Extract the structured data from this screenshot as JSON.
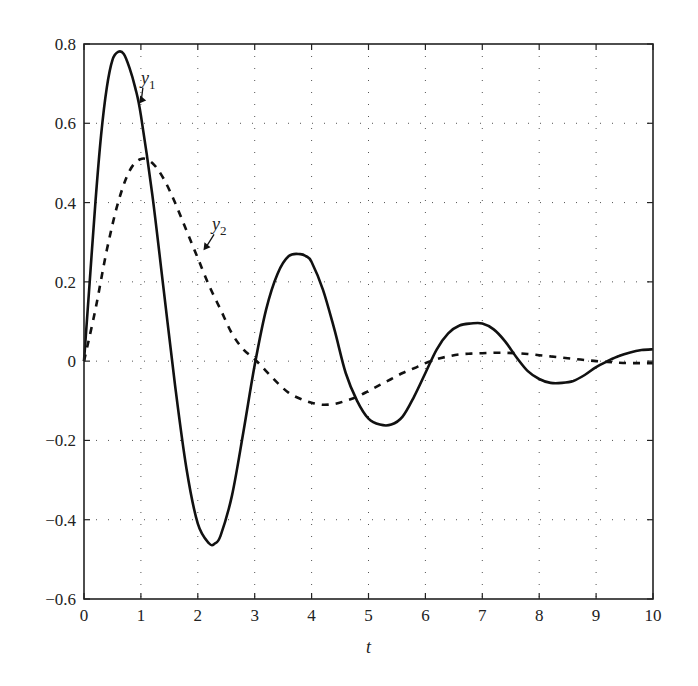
{
  "chart_data": {
    "type": "line",
    "title": "",
    "xlabel": "t",
    "ylabel": "",
    "xlim": [
      0,
      10
    ],
    "ylim": [
      -0.6,
      0.8
    ],
    "grid": true,
    "grid_style": "dotted",
    "xticks": [
      0,
      1,
      2,
      3,
      4,
      5,
      6,
      7,
      8,
      9,
      10
    ],
    "xtick_labels": [
      "0",
      "1",
      "2",
      "3",
      "4",
      "5",
      "6",
      "7",
      "8",
      "9",
      "10"
    ],
    "yticks": [
      -0.6,
      -0.4,
      -0.2,
      0,
      0.2,
      0.4,
      0.6,
      0.8
    ],
    "ytick_labels": [
      "−0.6",
      "−0.4",
      "−0.2",
      "0",
      "0.2",
      "0.4",
      "0.6",
      "0.8"
    ],
    "legend": "none (inline annotations)",
    "annotations": [
      {
        "text": "y1",
        "sub": "1",
        "base": "y",
        "x": 1.0,
        "y": 0.7,
        "arrow_to": [
          0.97,
          0.65
        ]
      },
      {
        "text": "y2",
        "sub": "2",
        "base": "y",
        "x": 2.25,
        "y": 0.33,
        "arrow_to": [
          2.1,
          0.28
        ]
      }
    ],
    "series": [
      {
        "name": "y1",
        "style": "solid",
        "x": [
          0,
          0.1,
          0.2,
          0.3,
          0.4,
          0.5,
          0.6,
          0.7,
          0.8,
          0.9,
          1.0,
          1.2,
          1.4,
          1.6,
          1.8,
          2.0,
          2.2,
          2.3,
          2.4,
          2.6,
          2.8,
          3.0,
          3.2,
          3.4,
          3.6,
          3.8,
          3.9,
          4.0,
          4.2,
          4.4,
          4.6,
          4.8,
          5.0,
          5.2,
          5.4,
          5.6,
          5.8,
          6.0,
          6.2,
          6.4,
          6.6,
          6.8,
          7.0,
          7.2,
          7.4,
          7.6,
          7.8,
          8.0,
          8.2,
          8.4,
          8.6,
          8.8,
          9.0,
          9.2,
          9.4,
          9.6,
          9.8,
          10.0
        ],
        "y": [
          0,
          0.2,
          0.4,
          0.57,
          0.69,
          0.76,
          0.78,
          0.775,
          0.74,
          0.69,
          0.62,
          0.42,
          0.18,
          -0.06,
          -0.27,
          -0.41,
          -0.46,
          -0.46,
          -0.44,
          -0.34,
          -0.18,
          -0.01,
          0.13,
          0.22,
          0.265,
          0.27,
          0.265,
          0.25,
          0.18,
          0.08,
          -0.03,
          -0.1,
          -0.145,
          -0.16,
          -0.16,
          -0.14,
          -0.09,
          -0.03,
          0.03,
          0.07,
          0.09,
          0.095,
          0.095,
          0.08,
          0.05,
          0.01,
          -0.025,
          -0.045,
          -0.055,
          -0.055,
          -0.05,
          -0.035,
          -0.015,
          0.0,
          0.013,
          0.022,
          0.028,
          0.03
        ]
      },
      {
        "name": "y2",
        "style": "dashed",
        "x": [
          0,
          0.2,
          0.4,
          0.6,
          0.8,
          1.0,
          1.2,
          1.4,
          1.6,
          1.8,
          2.0,
          2.2,
          2.4,
          2.6,
          2.8,
          3.0,
          3.2,
          3.4,
          3.6,
          3.8,
          4.0,
          4.2,
          4.4,
          4.6,
          4.8,
          5.0,
          5.2,
          5.4,
          5.6,
          5.8,
          6.0,
          6.2,
          6.4,
          6.6,
          6.8,
          7.0,
          7.2,
          7.4,
          7.6,
          7.8,
          8.0,
          8.2,
          8.4,
          8.6,
          8.8,
          9.0,
          9.2,
          9.4,
          9.6,
          9.8,
          10.0
        ],
        "y": [
          0,
          0.13,
          0.28,
          0.4,
          0.48,
          0.51,
          0.5,
          0.46,
          0.4,
          0.33,
          0.26,
          0.19,
          0.13,
          0.07,
          0.03,
          0.005,
          -0.025,
          -0.055,
          -0.08,
          -0.095,
          -0.105,
          -0.11,
          -0.108,
          -0.1,
          -0.09,
          -0.075,
          -0.06,
          -0.045,
          -0.03,
          -0.018,
          -0.005,
          0.005,
          0.012,
          0.017,
          0.019,
          0.02,
          0.021,
          0.021,
          0.02,
          0.018,
          0.015,
          0.012,
          0.009,
          0.006,
          0.003,
          0.0,
          -0.002,
          -0.004,
          -0.005,
          -0.005,
          -0.005
        ]
      }
    ]
  },
  "plot_area": {
    "left": 84,
    "right": 653,
    "top": 44,
    "bottom": 599
  }
}
